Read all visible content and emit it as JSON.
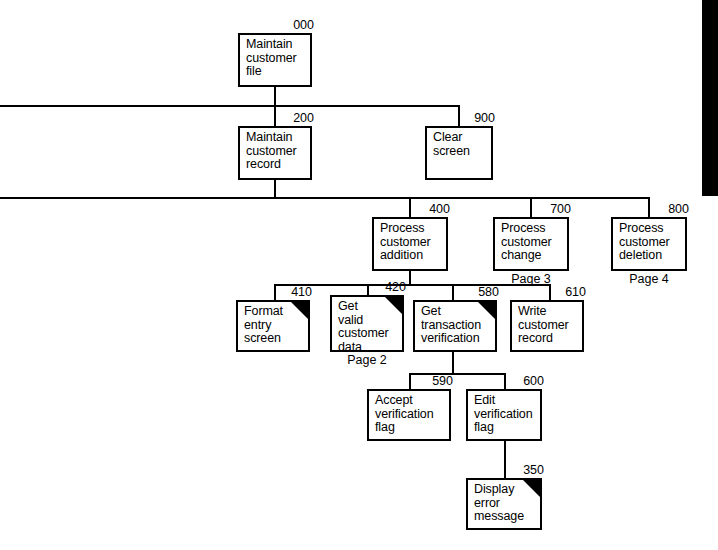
{
  "diagram": {
    "type": "structure-chart",
    "line_color": "#000000",
    "box_fill": "#ffffff",
    "background": "#ffffff",
    "flag_color": "#000000"
  },
  "modules": [
    {
      "id": "000",
      "number": "000",
      "text": "Maintain\ncustomer\nfile",
      "x": 238,
      "y": 33,
      "w": 74,
      "h": 54,
      "flag": false,
      "page_ref": null,
      "num_x": 238,
      "num_y": 19,
      "num_w": 76
    },
    {
      "id": "200",
      "number": "200",
      "text": "Maintain\ncustomer\nrecord",
      "x": 238,
      "y": 126,
      "w": 74,
      "h": 54,
      "flag": false,
      "page_ref": null,
      "num_x": 238,
      "num_y": 112,
      "num_w": 76
    },
    {
      "id": "900",
      "number": "900",
      "text": "Clear\nscreen",
      "x": 425,
      "y": 126,
      "w": 68,
      "h": 54,
      "flag": false,
      "page_ref": null,
      "num_x": 425,
      "num_y": 112,
      "num_w": 70
    },
    {
      "id": "400",
      "number": "400",
      "text": "Process\ncustomer\naddition",
      "x": 372,
      "y": 217,
      "w": 76,
      "h": 54,
      "flag": false,
      "page_ref": null,
      "num_x": 372,
      "num_y": 203,
      "num_w": 78
    },
    {
      "id": "700",
      "number": "700",
      "text": "Process\ncustomer\nchange",
      "x": 493,
      "y": 217,
      "w": 76,
      "h": 54,
      "flag": false,
      "page_ref": "Page 3",
      "ref_x": 493,
      "ref_y": 273,
      "ref_w": 76,
      "num_x": 493,
      "num_y": 203,
      "num_w": 78
    },
    {
      "id": "800",
      "number": "800",
      "text": "Process\ncustomer\ndeletion",
      "x": 611,
      "y": 217,
      "w": 76,
      "h": 54,
      "flag": false,
      "page_ref": "Page 4",
      "ref_x": 611,
      "ref_y": 273,
      "ref_w": 76,
      "num_x": 611,
      "num_y": 203,
      "num_w": 78
    },
    {
      "id": "410",
      "number": "410",
      "text": "Format\nentry\nscreen",
      "x": 236,
      "y": 300,
      "w": 74,
      "h": 52,
      "flag": true,
      "page_ref": null,
      "num_x": 236,
      "num_y": 286,
      "num_w": 76
    },
    {
      "id": "420",
      "number": "420",
      "text": "Get\nvalid\ncustomer\ndata",
      "x": 330,
      "y": 295,
      "w": 74,
      "h": 57,
      "flag": true,
      "page_ref": "Page 2",
      "ref_x": 330,
      "ref_y": 354,
      "ref_w": 74,
      "num_x": 330,
      "num_y": 281,
      "num_w": 76
    },
    {
      "id": "580",
      "number": "580",
      "text": "Get\ntransaction\nverification",
      "x": 413,
      "y": 300,
      "w": 84,
      "h": 52,
      "flag": true,
      "page_ref": null,
      "num_x": 413,
      "num_y": 286,
      "num_w": 86
    },
    {
      "id": "610",
      "number": "610",
      "text": "Write\ncustomer\nrecord",
      "x": 510,
      "y": 300,
      "w": 74,
      "h": 52,
      "flag": false,
      "page_ref": null,
      "num_x": 510,
      "num_y": 286,
      "num_w": 76
    },
    {
      "id": "590",
      "number": "590",
      "text": "Accept\nverification\nflag",
      "x": 367,
      "y": 389,
      "w": 84,
      "h": 52,
      "flag": false,
      "page_ref": null,
      "num_x": 367,
      "num_y": 375,
      "num_w": 86
    },
    {
      "id": "600",
      "number": "600",
      "text": "Edit\nverification\nflag",
      "x": 466,
      "y": 389,
      "w": 76,
      "h": 52,
      "flag": false,
      "page_ref": null,
      "num_x": 466,
      "num_y": 375,
      "num_w": 78
    },
    {
      "id": "350",
      "number": "350",
      "text": "Display\nerror\nmessage",
      "x": 466,
      "y": 478,
      "w": 76,
      "h": 52,
      "flag": true,
      "page_ref": null,
      "num_x": 466,
      "num_y": 464,
      "num_w": 78
    }
  ],
  "connectors": {
    "vertical": [
      {
        "name": "v-000-down",
        "x": 274,
        "y": 87,
        "h": 39
      },
      {
        "name": "v-200-up",
        "x": 274,
        "y": 105,
        "h": 21
      },
      {
        "name": "v-900-up",
        "x": 458,
        "y": 105,
        "h": 21
      },
      {
        "name": "v-200-down",
        "x": 274,
        "y": 180,
        "h": 17
      },
      {
        "name": "v-400-up",
        "x": 409,
        "y": 197,
        "h": 20
      },
      {
        "name": "v-700-up",
        "x": 530,
        "y": 197,
        "h": 20
      },
      {
        "name": "v-800-up",
        "x": 648,
        "y": 197,
        "h": 20
      },
      {
        "name": "v-400-down",
        "x": 409,
        "y": 271,
        "h": 13
      },
      {
        "name": "v-410-up",
        "x": 274,
        "y": 284,
        "h": 16
      },
      {
        "name": "v-420-up",
        "x": 367,
        "y": 284,
        "h": 11
      },
      {
        "name": "v-580-up",
        "x": 452,
        "y": 284,
        "h": 16
      },
      {
        "name": "v-610-up",
        "x": 549,
        "y": 284,
        "h": 16
      },
      {
        "name": "v-580-down",
        "x": 452,
        "y": 352,
        "h": 21
      },
      {
        "name": "v-590-up",
        "x": 409,
        "y": 373,
        "h": 16
      },
      {
        "name": "v-600-up",
        "x": 504,
        "y": 373,
        "h": 16
      },
      {
        "name": "v-600-down",
        "x": 504,
        "y": 441,
        "h": 37
      }
    ],
    "horizontal": [
      {
        "name": "bus-level2",
        "x": 0,
        "y": 105,
        "w": 459
      },
      {
        "name": "bus-level3",
        "x": 0,
        "y": 197,
        "w": 650
      },
      {
        "name": "bus-level4",
        "x": 274,
        "y": 284,
        "w": 277
      },
      {
        "name": "bus-level5",
        "x": 409,
        "y": 373,
        "w": 97
      }
    ]
  },
  "edge_bar": {
    "name": "page-edge-bar",
    "x": 702,
    "y": 0,
    "w": 16,
    "h": 196,
    "color": "#000000"
  }
}
